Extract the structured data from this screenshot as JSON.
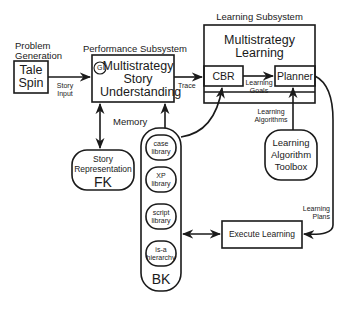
{
  "diagram": {
    "nodes": {
      "problem_generation": {
        "title": "Problem Generation",
        "title_lines": [
          "Problem",
          "Generation"
        ],
        "lines": [
          "Tale",
          "Spin"
        ]
      },
      "performance_subsystem": {
        "title": "Performance Subsystem",
        "symbol": "G",
        "lines": [
          "Multistrategy",
          "Story",
          "Understanding"
        ]
      },
      "learning_subsystem": {
        "title": "Learning Subsystem",
        "lines": [
          "Multistrategy",
          "Learning"
        ],
        "cbr": "CBR",
        "planner": "Planner"
      },
      "story_representation": {
        "lines": [
          "Story",
          "Representation"
        ],
        "tag": "FK"
      },
      "memory": {
        "label": "Memory",
        "tag": "BK",
        "libraries": [
          {
            "lines": [
              "case",
              "library"
            ]
          },
          {
            "lines": [
              "XP",
              "library"
            ]
          },
          {
            "lines": [
              "script",
              "library"
            ]
          },
          {
            "lines": [
              "is-a",
              "hierarchy"
            ]
          }
        ]
      },
      "toolbox": {
        "lines": [
          "Learning",
          "Algorithm",
          "Toolbox"
        ]
      },
      "execute_learning": {
        "label": "Execute Learning"
      }
    },
    "edges": {
      "story_input": [
        "Story",
        "Input"
      ],
      "trace": "Trace",
      "learning_goals": [
        "Learning",
        "Goals"
      ],
      "learning_algorithms": [
        "Learning",
        "Algorithms"
      ],
      "learning_plans": [
        "Learning",
        "Plans"
      ]
    }
  }
}
